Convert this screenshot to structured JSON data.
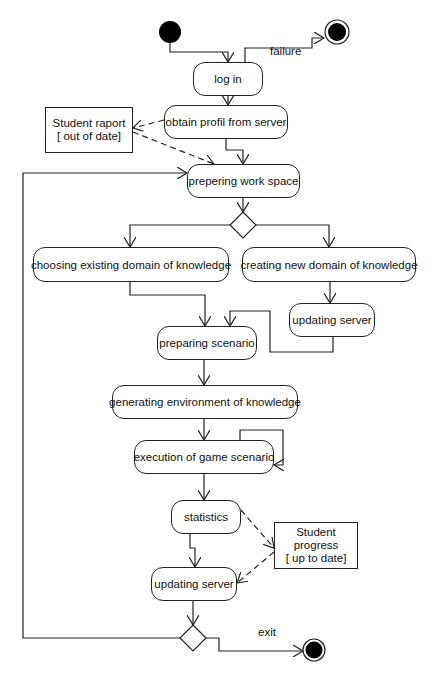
{
  "diagram": {
    "type": "UML activity diagram",
    "actions": [
      {
        "id": "login",
        "label": "log in",
        "x": 193,
        "y": 62,
        "w": 70,
        "h": 34
      },
      {
        "id": "obtain",
        "label": "obtain profil from server",
        "x": 164,
        "y": 105,
        "w": 124,
        "h": 34
      },
      {
        "id": "prepering",
        "label": "prepering work space",
        "x": 187,
        "y": 164,
        "w": 113,
        "h": 34
      },
      {
        "id": "choosing",
        "label": "choosing existing domain of knowledge",
        "x": 33,
        "y": 247,
        "w": 196,
        "h": 35
      },
      {
        "id": "creating",
        "label": "creating new domain of knowledge",
        "x": 242,
        "y": 247,
        "w": 174,
        "h": 35
      },
      {
        "id": "updating1",
        "label": "updating server",
        "x": 289,
        "y": 303,
        "w": 86,
        "h": 34
      },
      {
        "id": "preparing",
        "label": "preparing scenario",
        "x": 157,
        "y": 326,
        "w": 100,
        "h": 34
      },
      {
        "id": "generating",
        "label": "generating environment of knowledge",
        "x": 112,
        "y": 385,
        "w": 186,
        "h": 34
      },
      {
        "id": "execution",
        "label": "execution of game scenario",
        "x": 134,
        "y": 440,
        "w": 140,
        "h": 34
      },
      {
        "id": "statistics",
        "label": "statistics",
        "x": 171,
        "y": 500,
        "w": 70,
        "h": 34
      },
      {
        "id": "updating2",
        "label": "updating server",
        "x": 151,
        "y": 567,
        "w": 86,
        "h": 34
      }
    ],
    "objects": [
      {
        "id": "raport",
        "lines": [
          "Student raport",
          "[ out of date]"
        ],
        "x": 45,
        "y": 107,
        "w": 88,
        "h": 46
      },
      {
        "id": "progress",
        "lines": [
          "Student",
          "progress",
          "[ up to date]"
        ],
        "x": 274,
        "y": 522,
        "w": 84,
        "h": 47
      }
    ],
    "labels": [
      {
        "text": "failure",
        "x": 270,
        "y": 45
      },
      {
        "text": "exit",
        "x": 258,
        "y": 626
      }
    ],
    "initial_node": {
      "cx": 170,
      "cy": 32,
      "r": 11
    },
    "final_nodes": [
      {
        "cx": 337,
        "cy": 32,
        "r": 12
      },
      {
        "cx": 314,
        "cy": 650,
        "r": 11
      }
    ],
    "decisions": [
      {
        "cx": 243,
        "cy": 225,
        "s": 13
      },
      {
        "cx": 193,
        "cy": 638,
        "s": 13
      }
    ],
    "colors": {
      "stroke": "#222222",
      "fill": "#000000",
      "background": "#ffffff"
    }
  }
}
